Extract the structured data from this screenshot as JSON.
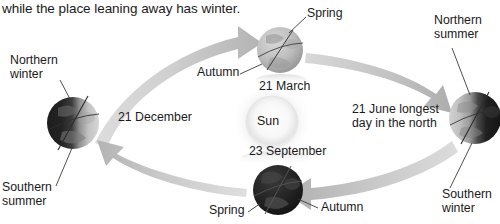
{
  "caption": {
    "text": "while the place leaning away has winter."
  },
  "diagram": {
    "type": "earth-seasons-orbit-diagram",
    "center_body": {
      "name": "Sun",
      "label": "Sun"
    },
    "orbit": {
      "direction": "counterclockwise",
      "arrow_color": "#b9b9b9"
    },
    "positions": [
      {
        "id": "december",
        "date_label": "21 December",
        "hemisphere_labels": [
          "Northern winter",
          "Southern summer"
        ],
        "equinox_solstice_labels": []
      },
      {
        "id": "march",
        "date_label": "21 March",
        "hemisphere_labels": [],
        "equinox_solstice_labels": [
          "Spring",
          "Autumn"
        ]
      },
      {
        "id": "june",
        "date_label": "21 June longest day in the north",
        "date_label_line1": "21 June longest",
        "date_label_line2": "day in the north",
        "hemisphere_labels": [
          "Northern summer",
          "Southern winter"
        ],
        "equinox_solstice_labels": []
      },
      {
        "id": "september",
        "date_label": "23 September",
        "hemisphere_labels": [],
        "equinox_solstice_labels": [
          "Spring",
          "Autumn"
        ]
      }
    ]
  },
  "labels": {
    "northern_winter_line1": "Northern",
    "northern_winter_line2": "winter",
    "southern_summer_line1": "Southern",
    "southern_summer_line2": "summer",
    "northern_summer_line1": "Northern",
    "northern_summer_line2": "summer",
    "southern_winter_line1": "Southern",
    "southern_winter_line2": "winter",
    "date_december": "21 December",
    "date_march": "21 March",
    "date_june_line1": "21 June longest",
    "date_june_line2": "day in the north",
    "date_september": "23 September",
    "spring_top": "Spring",
    "autumn_top": "Autumn",
    "spring_bottom": "Spring",
    "autumn_bottom": "Autumn",
    "sun": "Sun"
  },
  "colors": {
    "text": "#1a1a1a",
    "arrow": "#bcbcbc",
    "leader_line": "#3a3a3a",
    "earth_dark": "#1e1e1e",
    "earth_light": "#c9c9c9",
    "sun_glow": "#f0f0f0"
  }
}
